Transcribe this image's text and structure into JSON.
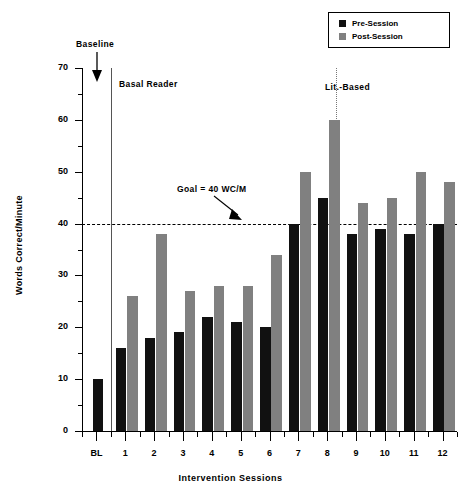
{
  "chart_data": {
    "type": "bar",
    "title": "",
    "xlabel": "Intervention Sessions",
    "ylabel": "Words Correct/Minute",
    "categories": [
      "BL",
      "1",
      "2",
      "3",
      "4",
      "5",
      "6",
      "7",
      "8",
      "9",
      "10",
      "11",
      "12"
    ],
    "series": [
      {
        "name": "Pre-Session",
        "color": "#111111",
        "values": [
          10,
          16,
          18,
          19,
          22,
          21,
          20,
          40,
          45,
          38,
          39,
          38,
          40
        ]
      },
      {
        "name": "Post-Session",
        "color": "#808080",
        "values": [
          null,
          26,
          38,
          27,
          28,
          28,
          34,
          50,
          60,
          44,
          45,
          50,
          48
        ]
      }
    ],
    "ylim": [
      0,
      70
    ],
    "ytick_labels": [
      "0",
      "10",
      "20",
      "30",
      "40",
      "50",
      "60",
      "70"
    ],
    "ytick_values": [
      0,
      10,
      20,
      30,
      40,
      50,
      60,
      70
    ],
    "yminor_step": 5,
    "grid": false,
    "legend_position": "top-right",
    "reference_lines": [
      {
        "name": "goal",
        "value": 40,
        "style": "dashed",
        "label": "Goal = 40 WC/M"
      }
    ],
    "phase_lines": [
      {
        "name": "baseline-phase-change",
        "after_category": "BL",
        "style": "solid",
        "label": "Basal Reader"
      },
      {
        "name": "lit-based-phase-change",
        "after_category": "8",
        "style": "dotted",
        "label": "Lit.-Based"
      }
    ],
    "annotations": [
      {
        "name": "baseline",
        "text": "Baseline"
      },
      {
        "name": "basal-reader",
        "text": "Basal Reader"
      },
      {
        "name": "lit-based",
        "text": "Lit.-Based"
      },
      {
        "name": "goal",
        "text": "Goal = 40 WC/M"
      }
    ]
  },
  "legend": {
    "items": [
      {
        "label": "Pre-Session",
        "color": "#111111"
      },
      {
        "label": "Post-Session",
        "color": "#808080"
      }
    ]
  },
  "axes": {
    "y_title": "Words Correct/Minute",
    "x_title": "Intervention Sessions"
  }
}
